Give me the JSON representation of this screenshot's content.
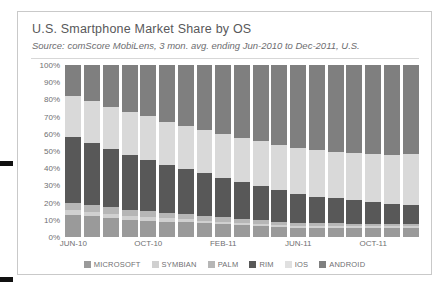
{
  "edge_marks": [
    "crop-mark-top",
    "crop-mark-bottom"
  ],
  "header": {
    "title": "U.S. Smartphone Market Share by OS",
    "subtitle": "Source: comScore MobiLens, 3 mon. avg. ending Jun-2010 to Dec-2011, U.S."
  },
  "chart_data": {
    "type": "bar",
    "subtype": "stacked-percent",
    "title": "U.S. Smartphone Market Share by OS",
    "subtitle": "Source: comScore MobiLens, 3 mon. avg. ending Jun-2010 to Dec-2011, U.S.",
    "xlabel": "",
    "ylabel": "",
    "ylim": [
      0,
      100
    ],
    "yticks": [
      "0%",
      "10%",
      "20%",
      "30%",
      "40%",
      "50%",
      "60%",
      "70%",
      "80%",
      "90%",
      "100%"
    ],
    "ytick_values": [
      0,
      10,
      20,
      30,
      40,
      50,
      60,
      70,
      80,
      90,
      100
    ],
    "grid": false,
    "legend_position": "bottom",
    "categories": [
      "JUN-10",
      "JUL-10",
      "AUG-10",
      "SEP-10",
      "OCT-10",
      "NOV-10",
      "DEC-10",
      "JAN-11",
      "FEB-11",
      "MAR-11",
      "APR-11",
      "MAY-11",
      "JUN-11",
      "JUL-11",
      "AUG-11",
      "SEP-11",
      "OCT-11",
      "NOV-11",
      "DEC-11"
    ],
    "xtick_labels": [
      "JUN-10",
      "OCT-10",
      "FEB-11",
      "JUN-11",
      "OCT-11"
    ],
    "xtick_indices": [
      0,
      4,
      8,
      12,
      16
    ],
    "series": [
      {
        "name": "MICROSOFT",
        "color": "#9a9a9a",
        "values": [
          13.0,
          12.0,
          11.0,
          10.0,
          9.5,
          9.0,
          8.5,
          8.0,
          7.5,
          7.0,
          6.5,
          6.0,
          5.5,
          5.5,
          5.5,
          5.5,
          5.5,
          5.5,
          5.5
        ]
      },
      {
        "name": "SYMBIAN",
        "color": "#d0d0d0",
        "values": [
          2.5,
          2.3,
          2.2,
          2.0,
          1.9,
          1.8,
          1.7,
          1.6,
          1.5,
          1.4,
          1.3,
          1.2,
          1.1,
          1.0,
          1.0,
          1.0,
          1.0,
          1.0,
          1.0
        ]
      },
      {
        "name": "PALM",
        "color": "#b6b6b6",
        "values": [
          4.5,
          4.2,
          4.0,
          3.8,
          3.5,
          3.3,
          3.0,
          2.8,
          2.5,
          2.3,
          2.0,
          1.8,
          1.6,
          1.5,
          1.4,
          1.3,
          1.2,
          1.2,
          1.2
        ]
      },
      {
        "name": "RIM",
        "color": "#585858",
        "values": [
          38.0,
          36.0,
          34.0,
          32.0,
          30.0,
          28.0,
          26.5,
          25.0,
          23.0,
          21.5,
          20.0,
          18.5,
          17.0,
          15.5,
          14.5,
          13.5,
          12.5,
          11.5,
          11.0
        ]
      },
      {
        "name": "IOS",
        "color": "#d9d9d9",
        "values": [
          24.0,
          24.5,
          24.5,
          25.0,
          25.5,
          25.0,
          25.0,
          25.0,
          25.5,
          25.5,
          26.0,
          26.0,
          26.5,
          27.0,
          27.0,
          27.5,
          28.0,
          28.5,
          29.5
        ]
      },
      {
        "name": "ANDROID",
        "color": "#7f7f7f",
        "values": [
          18.0,
          21.0,
          24.3,
          27.2,
          29.6,
          32.9,
          35.3,
          37.6,
          40.0,
          42.3,
          44.2,
          46.5,
          48.3,
          49.5,
          50.6,
          51.2,
          51.8,
          52.3,
          51.8
        ]
      }
    ],
    "legend": [
      {
        "label": "MICROSOFT",
        "color": "#9a9a9a"
      },
      {
        "label": "SYMBIAN",
        "color": "#d0d0d0"
      },
      {
        "label": "PALM",
        "color": "#b6b6b6"
      },
      {
        "label": "RIM",
        "color": "#585858"
      },
      {
        "label": "IOS",
        "color": "#e0e0e0"
      },
      {
        "label": "ANDROID",
        "color": "#7f7f7f"
      }
    ]
  }
}
